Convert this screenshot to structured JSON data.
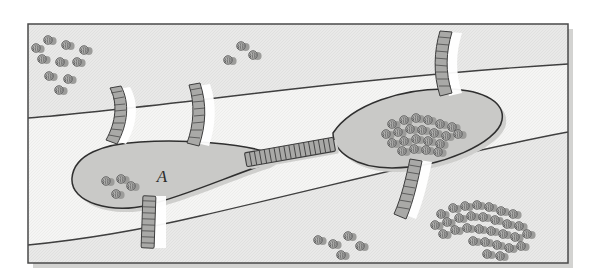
{
  "figure": {
    "kind": "landscape-habitat-connectivity-map",
    "frame": {
      "x": 28,
      "y": 24,
      "width": 540,
      "height": 239
    },
    "background_color": "#f2f2f0",
    "frame_border_color": "#4a4a4a",
    "shadow_color": "#cfcfcd"
  },
  "zones": {
    "description": "Three horizontal landscape bands separated by two curving boundary lines",
    "boundary_line_color": "#3f3f3f",
    "items": [
      {
        "name": "upper-band",
        "fill": "#d6d6d4",
        "note": "darker matrix band across top"
      },
      {
        "name": "middle-band",
        "fill": "#ececea",
        "note": "lighter central corridor band"
      },
      {
        "name": "lower-band",
        "fill": "#d6d6d4",
        "note": "darker matrix band across bottom"
      }
    ]
  },
  "patches": [
    {
      "id": "patch-a",
      "label": "A",
      "label_x": 162,
      "label_y": 182,
      "shape": "irregular-teardrop",
      "fill": "#c9c9c7",
      "outline": "#333333"
    },
    {
      "id": "patch-b",
      "label": "",
      "shape": "lens-ellipse",
      "fill": "#c9c9c7",
      "outline": "#333333"
    }
  ],
  "corridor": {
    "name": "central-corridor",
    "description": "hatched ladder band linking patch A to patch B",
    "fill": "#a9a9a7",
    "rung_color": "#3d3d3d"
  },
  "crossings": {
    "description": "Hatched ladder/fence segments crossing boundary and patch edges",
    "fill": "#a9a9a7",
    "rung_color": "#3d3d3d",
    "count": 6
  },
  "tree_groups": [
    {
      "name": "trees-upper-left",
      "count": 10
    },
    {
      "name": "trees-upper-center",
      "count": 3
    },
    {
      "name": "trees-patch-a",
      "count": 4
    },
    {
      "name": "trees-patch-b",
      "count": 22
    },
    {
      "name": "trees-lower-center",
      "count": 5
    },
    {
      "name": "trees-lower-right",
      "count": 30
    }
  ],
  "tree_style": {
    "canopy_fill": "#b4b4b2",
    "canopy_stroke": "#5a5a5a",
    "shadow_fill": "#9c9c9a"
  }
}
